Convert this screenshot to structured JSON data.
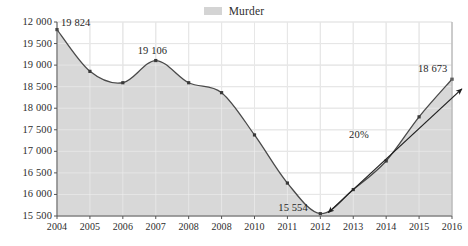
{
  "legend": {
    "swatch_color": "#d4d4d4",
    "entries": [
      {
        "label": "Murder",
        "color": "#d4d4d4"
      }
    ],
    "position": "top-center"
  },
  "chart_data": {
    "type": "area",
    "title": "",
    "subtitle": "",
    "xlabel": "",
    "ylabel": "",
    "grid": true,
    "legend_position": "top-center",
    "series_name": "Murder",
    "fill_color": "#d6d6d6",
    "line_color": "#4a4a4a",
    "marker_color": "#3a3a3a",
    "categories": [
      "2004",
      "2005",
      "2006",
      "2007",
      "2008",
      "2008",
      "2010",
      "2011",
      "2012",
      "2013",
      "2014",
      "2015",
      "2016"
    ],
    "x": [
      2004,
      2005,
      2006,
      2007,
      2008,
      2009,
      2010,
      2011,
      2012,
      2013,
      2014,
      2015,
      2016
    ],
    "values": [
      19824,
      18855,
      18591,
      19106,
      18591,
      18361,
      17380,
      16264,
      15554,
      16113,
      16777,
      17800,
      18673
    ],
    "ylim": [
      15500,
      20000
    ],
    "yticks": [
      15500,
      16000,
      16500,
      17000,
      17500,
      18000,
      18500,
      19000,
      19500,
      20000
    ],
    "ytick_labels": [
      "15 500",
      "16 000",
      "16 500",
      "17 000",
      "17 500",
      "18 000",
      "18 500",
      "19 000",
      "19 500",
      "12 000"
    ],
    "point_labels": [
      {
        "category": "2004",
        "value": 19824,
        "text": "19 824"
      },
      {
        "category": "2007",
        "value": 19106,
        "text": "19 106"
      },
      {
        "category": "2012",
        "value": 15554,
        "text": "15 554"
      },
      {
        "category": "2016",
        "value": 18673,
        "text": "18 673"
      }
    ],
    "annotations": [
      {
        "text": "20%",
        "type": "double-arrow",
        "from_category": "2012",
        "from_value": 15554,
        "to_category": "2016",
        "to_value": 18673
      }
    ]
  }
}
